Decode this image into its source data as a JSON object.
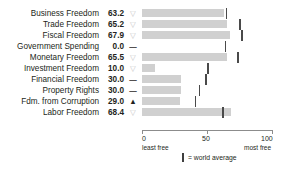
{
  "title": "COUNTRY RANKINGS FOR ECONOMIC FREEDOM",
  "axis": {
    "ticks": [
      "0",
      "50",
      "100"
    ],
    "left_caption": "least free",
    "right_caption": "most free",
    "min": 0,
    "max": 100
  },
  "legend": {
    "marker": "|",
    "text": "= world average"
  },
  "chart_data": {
    "type": "bar",
    "title": "COUNTRY RANKINGS FOR ECONOMIC FREEDOM",
    "xlabel": "",
    "ylabel": "",
    "xlim": [
      0,
      100
    ],
    "grid": false,
    "orientation": "horizontal",
    "legend_position": "bottom",
    "categories": [
      "Business Freedom",
      "Trade Freedom",
      "Fiscal Freedom",
      "Government Spending",
      "Monetary Freedom",
      "Investment Freedom",
      "Financial Freedom",
      "Property Rights",
      "Fdm. from Corruption",
      "Labor Freedom"
    ],
    "values": [
      63.2,
      65.2,
      67.9,
      0.0,
      65.5,
      10.0,
      30.0,
      30.0,
      29.0,
      68.4
    ],
    "world_average": [
      64.3,
      74.8,
      76.3,
      63.6,
      73.4,
      50.2,
      48.5,
      43.6,
      40.5,
      61.5
    ],
    "series": [
      {
        "name": "Country score",
        "values": [
          63.2,
          65.2,
          67.9,
          0.0,
          65.5,
          10.0,
          30.0,
          30.0,
          29.0,
          68.4
        ]
      },
      {
        "name": "World average",
        "values": [
          64.3,
          74.8,
          76.3,
          63.6,
          73.4,
          50.2,
          48.5,
          43.6,
          40.5,
          61.5
        ]
      }
    ],
    "colors": {
      "bar": "#d0d0d0",
      "average_tick": "#4a4a4a",
      "text": "#231f20"
    }
  },
  "rows": [
    {
      "label": "Business Freedom",
      "value": "63.2",
      "marker": "▽",
      "marker_kind": "down",
      "score": 63.2,
      "avg": 64.3
    },
    {
      "label": "Trade Freedom",
      "value": "65.2",
      "marker": "▽",
      "marker_kind": "down",
      "score": 65.2,
      "avg": 74.8
    },
    {
      "label": "Fiscal Freedom",
      "value": "67.9",
      "marker": "▽",
      "marker_kind": "down",
      "score": 67.9,
      "avg": 76.3
    },
    {
      "label": "Government Spending",
      "value": "0.0",
      "marker": "—",
      "marker_kind": "flat",
      "score": 0.0,
      "avg": 63.6
    },
    {
      "label": "Monetary Freedom",
      "value": "65.5",
      "marker": "▽",
      "marker_kind": "down",
      "score": 65.5,
      "avg": 73.4
    },
    {
      "label": "Investment Freedom",
      "value": "10.0",
      "marker": "▽",
      "marker_kind": "down",
      "score": 10.0,
      "avg": 50.2
    },
    {
      "label": "Financial Freedom",
      "value": "30.0",
      "marker": "—",
      "marker_kind": "flat",
      "score": 30.0,
      "avg": 48.5
    },
    {
      "label": "Property Rights",
      "value": "30.0",
      "marker": "—",
      "marker_kind": "flat",
      "score": 30.0,
      "avg": 43.6
    },
    {
      "label": "Fdm. from Corruption",
      "value": "29.0",
      "marker": "▲",
      "marker_kind": "up",
      "score": 29.0,
      "avg": 40.5
    },
    {
      "label": "Labor Freedom",
      "value": "68.4",
      "marker": "▽",
      "marker_kind": "down",
      "score": 68.4,
      "avg": 61.5
    }
  ]
}
